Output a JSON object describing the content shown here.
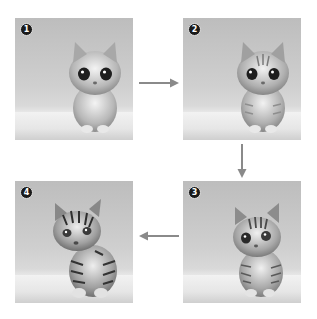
{
  "diagram": {
    "type": "sequence-grid",
    "flow_order": [
      1,
      2,
      3,
      4
    ],
    "panels": [
      {
        "id": 1,
        "badge": "❶",
        "label": "Fluffy gray kitten with large dark eyes",
        "position": "top-left",
        "stripe_level": 0
      },
      {
        "id": 2,
        "badge": "❷",
        "label": "Kitten with faint tabby markings",
        "position": "top-right",
        "stripe_level": 1
      },
      {
        "id": 3,
        "badge": "❸",
        "label": "Tabby kitten with stronger stripes",
        "position": "bottom-right",
        "stripe_level": 2
      },
      {
        "id": 4,
        "badge": "❹",
        "label": "Tiger cub",
        "position": "bottom-left",
        "stripe_level": 3
      }
    ],
    "arrows": [
      {
        "from": 1,
        "to": 2,
        "direction": "right"
      },
      {
        "from": 2,
        "to": 3,
        "direction": "down"
      },
      {
        "from": 3,
        "to": 4,
        "direction": "left"
      }
    ],
    "colors": {
      "background": "#ffffff",
      "arrow": "#8a8a8a",
      "badge_bg": "#1a1a1a",
      "badge_fg": "#ffffff"
    }
  }
}
